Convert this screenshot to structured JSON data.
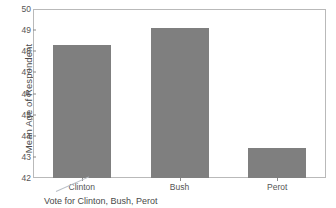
{
  "chart_data": {
    "type": "bar",
    "title": "",
    "xlabel": "Vote for Clinton, Bush, Perot",
    "ylabel": "Mean Age of Respondent",
    "categories": [
      "Clinton",
      "Bush",
      "Perot"
    ],
    "values": [
      48.3,
      49.1,
      43.4
    ],
    "ylim": [
      42,
      50
    ],
    "yticks": [
      42,
      43,
      44,
      45,
      46,
      47,
      48,
      49,
      50
    ],
    "ytick_labels": [
      "42",
      "43",
      "44",
      "45",
      "46",
      "47",
      "48",
      "49",
      "50"
    ],
    "grid": false,
    "legend": false,
    "bar_color": "#7f7f7f",
    "frame_color": "#b9b9b9",
    "background": "#ffffff"
  }
}
